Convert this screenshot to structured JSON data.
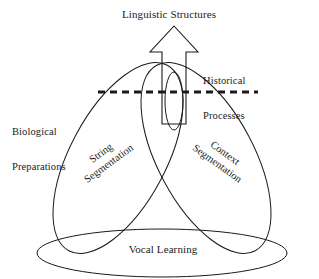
{
  "figure": {
    "type": "conceptual-diagram",
    "background_color": "#ffffff",
    "stroke_color": "#1a1a1a",
    "text_color": "#1a1a1a"
  },
  "labels": {
    "top_arrow": "Linguistic Structures",
    "right_side_line1": "Historical",
    "right_side_line2": "Processes",
    "left_side_line1": "Biological",
    "left_side_line2": "Preparations",
    "left_lobe_line1": "String",
    "left_lobe_line2": "Segmentation",
    "right_lobe_line1": "Context",
    "right_lobe_line2": "Segmentation",
    "base_ellipse": "Vocal Learning"
  },
  "shapes": {
    "arrow": {
      "name": "up-arrow",
      "apex_x": 174,
      "apex_y": 26,
      "head_left_x": 150,
      "head_right_x": 198,
      "head_base_y": 52,
      "shaft_left_x": 162,
      "shaft_right_x": 186,
      "shaft_bottom_y": 124
    },
    "dashed_line": {
      "name": "historical-boundary",
      "x1": 98,
      "x2": 258,
      "y": 92,
      "stroke_width": 3,
      "dash": "7 5"
    },
    "inner_ellipse": {
      "name": "narrow-vertical-ellipse",
      "cx": 174,
      "cy": 101,
      "rx": 9,
      "ry": 29
    },
    "left_lobe": {
      "name": "biological-left-lobe",
      "cx": 118,
      "cy": 158,
      "rx": 48,
      "ry": 105,
      "rotation_deg": 28
    },
    "right_lobe": {
      "name": "biological-right-lobe",
      "cx": 206,
      "cy": 158,
      "rx": 48,
      "ry": 105,
      "rotation_deg": -28
    },
    "base_ellipse": {
      "name": "vocal-learning-ellipse",
      "cx": 162,
      "cy": 253,
      "rx": 125,
      "ry": 24
    }
  }
}
